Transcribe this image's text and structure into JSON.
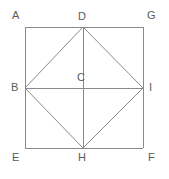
{
  "diagram": {
    "type": "geometry-figure",
    "background_color": "#ffffff",
    "stroke_color": "#8a8a8a",
    "label_color": "#5a5a5a",
    "stroke_width": 1,
    "canvas": {
      "width": 169,
      "height": 179
    },
    "points": [
      {
        "id": "A",
        "label": "A",
        "x": 25,
        "y": 27,
        "label_x": 12,
        "label_y": 10,
        "role": "square-corner-top-left"
      },
      {
        "id": "D",
        "label": "D",
        "x": 83,
        "y": 27,
        "label_x": 78,
        "label_y": 11,
        "role": "midpoint-top"
      },
      {
        "id": "G",
        "label": "G",
        "x": 143,
        "y": 27,
        "label_x": 147,
        "label_y": 10,
        "role": "square-corner-top-right"
      },
      {
        "id": "B",
        "label": "B",
        "x": 25,
        "y": 88,
        "label_x": 11,
        "label_y": 82,
        "role": "midpoint-left"
      },
      {
        "id": "C",
        "label": "C",
        "x": 83,
        "y": 88,
        "label_x": 77,
        "label_y": 72,
        "role": "center"
      },
      {
        "id": "I",
        "label": "I",
        "x": 143,
        "y": 88,
        "label_x": 149,
        "label_y": 82,
        "role": "midpoint-right"
      },
      {
        "id": "E",
        "label": "E",
        "x": 25,
        "y": 148,
        "label_x": 12,
        "label_y": 152,
        "role": "square-corner-bottom-left"
      },
      {
        "id": "H",
        "label": "H",
        "x": 83,
        "y": 148,
        "label_x": 78,
        "label_y": 152,
        "role": "midpoint-bottom"
      },
      {
        "id": "F",
        "label": "F",
        "x": 143,
        "y": 148,
        "label_x": 148,
        "label_y": 152,
        "role": "square-corner-bottom-right"
      }
    ],
    "segments": [
      {
        "name": "outer-square-top",
        "from": "A",
        "to": "G"
      },
      {
        "name": "outer-square-right",
        "from": "G",
        "to": "F"
      },
      {
        "name": "outer-square-bottom",
        "from": "F",
        "to": "E"
      },
      {
        "name": "outer-square-left",
        "from": "E",
        "to": "A"
      },
      {
        "name": "inner-square-DB",
        "from": "D",
        "to": "B"
      },
      {
        "name": "inner-square-DI",
        "from": "D",
        "to": "I"
      },
      {
        "name": "inner-square-BH",
        "from": "B",
        "to": "H"
      },
      {
        "name": "inner-square-IH",
        "from": "I",
        "to": "H"
      },
      {
        "name": "vertical-diagonal-DH",
        "from": "D",
        "to": "H"
      },
      {
        "name": "horizontal-diagonal-BI",
        "from": "B",
        "to": "I"
      }
    ]
  }
}
